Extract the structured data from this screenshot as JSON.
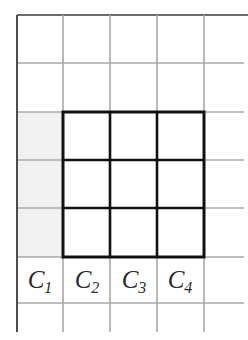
{
  "diagram": {
    "type": "grid-with-highlight",
    "colors": {
      "background": "#ffffff",
      "grid_line": "#a8a8a8",
      "border_line": "#3a3a3a",
      "bold_square": "#111111",
      "shaded_cells": "#f1f1f1"
    },
    "grid": {
      "columns_x": [
        17,
        63,
        110,
        157,
        204
      ],
      "rows_y": [
        15,
        63,
        112,
        160,
        208,
        257,
        303
      ],
      "right_extent": 244,
      "top_right_extent": 248,
      "bottom_extent": 332
    },
    "bold_square": {
      "x1": 63,
      "y1": 112,
      "x2": 204,
      "y2": 257,
      "inner_lines_x": [
        110,
        157
      ],
      "inner_lines_y": [
        160,
        208
      ]
    },
    "shaded_region": {
      "x1": 17,
      "y1": 112,
      "x2": 63,
      "y2": 257
    },
    "column_labels": [
      {
        "base": "C",
        "sub": "1",
        "x": 40,
        "y": 281
      },
      {
        "base": "C",
        "sub": "2",
        "x": 87,
        "y": 281
      },
      {
        "base": "C",
        "sub": "3",
        "x": 134,
        "y": 281
      },
      {
        "base": "C",
        "sub": "4",
        "x": 180,
        "y": 281
      }
    ]
  }
}
